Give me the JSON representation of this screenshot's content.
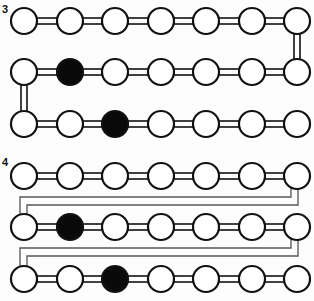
{
  "panels": [
    {
      "label": "3",
      "rows_y": [
        21,
        72,
        124
      ],
      "filled": [
        [
          1,
          1
        ],
        [
          2,
          2
        ]
      ],
      "connector": "double-bar links in serpentine; right end row0-row1, left end row1-row2"
    },
    {
      "label": "4",
      "rows_y": [
        176,
        227,
        279
      ],
      "filled": [
        [
          1,
          1
        ],
        [
          2,
          2
        ]
      ],
      "connector": "double wire from right-end bottom wrapping to left-end of next row"
    }
  ],
  "columns_x": [
    24,
    70,
    115,
    161,
    206,
    252,
    297
  ],
  "circle_radius": 13,
  "colors": {
    "stroke": "#111111",
    "fill_empty": "#ffffff",
    "fill_filled": "#0a0a0a",
    "wire": "#555555"
  }
}
